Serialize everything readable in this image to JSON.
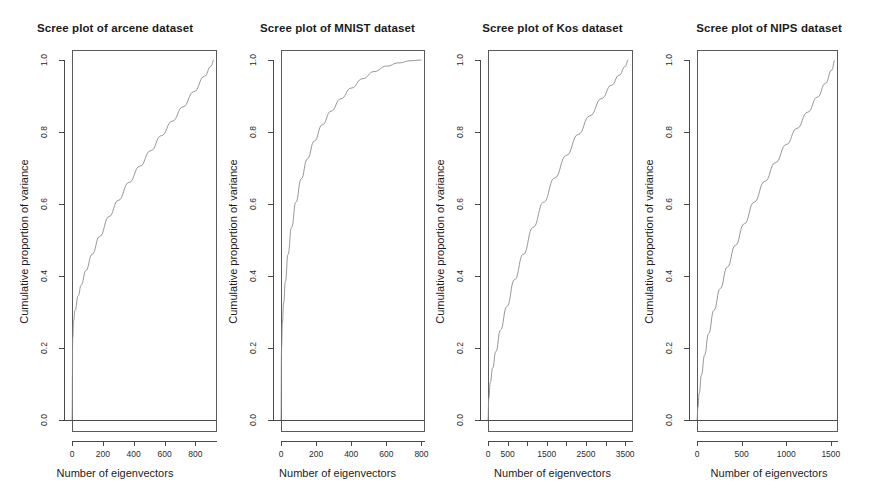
{
  "figure": {
    "background": "#ffffff",
    "line_color": "#8a8a8a",
    "axis_color": "#4a4a4a",
    "panel_count": 4
  },
  "axis_titles": {
    "x": "Number of eigenvectors",
    "y": "Cumulative proportion of variance"
  },
  "chart_data": [
    {
      "type": "line",
      "title": "Scree plot of arcene dataset",
      "xlabel": "Number of eigenvectors",
      "ylabel": "Cumulative proportion of variance",
      "xlim": [
        0,
        940
      ],
      "ylim": [
        0.0,
        1.03
      ],
      "grid": false,
      "legend": "none",
      "xticks": [
        0,
        200,
        400,
        600,
        800
      ],
      "xticklabels": [
        "0",
        "200",
        "400",
        "600",
        "800"
      ],
      "yticks": [
        0.0,
        0.2,
        0.4,
        0.6,
        0.8,
        1.0
      ],
      "yticklabels": [
        "0.0",
        "0.2",
        "0.4",
        "0.6",
        "0.8",
        "1.0"
      ],
      "x": [
        0,
        5,
        10,
        20,
        40,
        60,
        90,
        130,
        180,
        240,
        300,
        370,
        440,
        510,
        580,
        650,
        720,
        790,
        860,
        900,
        920
      ],
      "y": [
        0.0,
        0.23,
        0.275,
        0.305,
        0.345,
        0.375,
        0.415,
        0.46,
        0.51,
        0.565,
        0.61,
        0.66,
        0.705,
        0.748,
        0.79,
        0.83,
        0.87,
        0.912,
        0.955,
        0.982,
        1.0
      ]
    },
    {
      "type": "line",
      "title": "Scree plot of MNIST dataset",
      "xlabel": "Number of eigenvectors",
      "ylabel": "Cumulative proportion of variance",
      "xlim": [
        0,
        820
      ],
      "ylim": [
        0.0,
        1.03
      ],
      "grid": false,
      "legend": "none",
      "xticks": [
        0,
        200,
        400,
        600,
        800
      ],
      "xticklabels": [
        "0",
        "200",
        "400",
        "600",
        "800"
      ],
      "yticks": [
        0.0,
        0.2,
        0.4,
        0.6,
        0.8,
        1.0
      ],
      "yticklabels": [
        "0.0",
        "0.2",
        "0.4",
        "0.6",
        "0.8",
        "1.0"
      ],
      "x": [
        0,
        3,
        8,
        15,
        25,
        40,
        60,
        85,
        115,
        150,
        190,
        235,
        285,
        340,
        400,
        465,
        530,
        600,
        670,
        740,
        800
      ],
      "y": [
        0.0,
        0.2,
        0.27,
        0.325,
        0.385,
        0.46,
        0.535,
        0.605,
        0.67,
        0.725,
        0.775,
        0.82,
        0.858,
        0.892,
        0.922,
        0.948,
        0.968,
        0.983,
        0.992,
        0.998,
        1.0
      ]
    },
    {
      "type": "line",
      "title": "Scree plot of Kos dataset",
      "xlabel": "Number of eigenvectors",
      "ylabel": "Cumulative proportion of variance",
      "xlim": [
        0,
        3700
      ],
      "ylim": [
        0.0,
        1.03
      ],
      "grid": false,
      "legend": "none",
      "xticks": [
        0,
        500,
        1000,
        1500,
        2000,
        2500,
        3000,
        3500
      ],
      "xticklabels": [
        "0",
        "500",
        "",
        "1500",
        "",
        "2500",
        "",
        "3500"
      ],
      "yticks": [
        0.0,
        0.2,
        0.4,
        0.6,
        0.8,
        1.0
      ],
      "yticklabels": [
        "0.0",
        "0.2",
        "0.4",
        "0.6",
        "0.8",
        "1.0"
      ],
      "x": [
        0,
        20,
        60,
        120,
        200,
        320,
        480,
        680,
        900,
        1150,
        1420,
        1700,
        2000,
        2300,
        2600,
        2900,
        3150,
        3350,
        3500,
        3580
      ],
      "y": [
        0.0,
        0.06,
        0.105,
        0.145,
        0.19,
        0.25,
        0.315,
        0.39,
        0.46,
        0.535,
        0.605,
        0.672,
        0.735,
        0.793,
        0.845,
        0.893,
        0.93,
        0.958,
        0.982,
        1.0
      ]
    },
    {
      "type": "line",
      "title": "Scree plot of NIPS dataset",
      "xlabel": "Number of eigenvectors",
      "ylabel": "Cumulative proportion of variance",
      "xlim": [
        0,
        1580
      ],
      "ylim": [
        0.0,
        1.03
      ],
      "grid": false,
      "legend": "none",
      "xticks": [
        0,
        500,
        1000,
        1500
      ],
      "xticklabels": [
        "0",
        "500",
        "1000",
        "1500"
      ],
      "yticks": [
        0.0,
        0.2,
        0.4,
        0.6,
        0.8,
        1.0
      ],
      "yticklabels": [
        "0.0",
        "0.2",
        "0.4",
        "0.6",
        "0.8",
        "1.0"
      ],
      "x": [
        0,
        10,
        25,
        50,
        85,
        130,
        190,
        260,
        340,
        430,
        530,
        640,
        760,
        880,
        1000,
        1120,
        1240,
        1350,
        1440,
        1510,
        1545
      ],
      "y": [
        0.0,
        0.035,
        0.075,
        0.125,
        0.18,
        0.24,
        0.305,
        0.365,
        0.425,
        0.485,
        0.545,
        0.605,
        0.663,
        0.715,
        0.765,
        0.81,
        0.855,
        0.897,
        0.935,
        0.972,
        1.0
      ]
    }
  ],
  "panel_geometry": [
    {
      "left": 0,
      "width": 230,
      "box_left": 72,
      "box_right": 217
    },
    {
      "left": 230,
      "width": 215,
      "box_left": 51,
      "box_right": 195
    },
    {
      "left": 445,
      "width": 215,
      "box_left": 43,
      "box_right": 188
    },
    {
      "left": 660,
      "width": 218,
      "box_left": 37,
      "box_right": 178
    }
  ]
}
